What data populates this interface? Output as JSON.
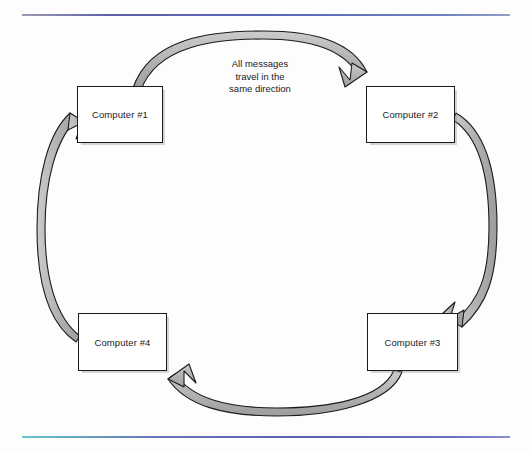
{
  "diagram": {
    "type": "ring-network-topology",
    "background_color": "#fdfdfd",
    "annotation": {
      "lines": [
        "All messages",
        "travel in the",
        "same direction"
      ],
      "full_text": "All messages travel in the same direction"
    },
    "nodes": [
      {
        "id": "computer-1",
        "label": "Computer #1",
        "position": "top-left"
      },
      {
        "id": "computer-2",
        "label": "Computer #2",
        "position": "top-right"
      },
      {
        "id": "computer-3",
        "label": "Computer #3",
        "position": "bottom-right"
      },
      {
        "id": "computer-4",
        "label": "Computer #4",
        "position": "bottom-left"
      }
    ],
    "connections": [
      {
        "from": "computer-1",
        "to": "computer-2",
        "arc": "top",
        "direction": "clockwise"
      },
      {
        "from": "computer-2",
        "to": "computer-3",
        "arc": "right",
        "direction": "clockwise"
      },
      {
        "from": "computer-3",
        "to": "computer-4",
        "arc": "bottom",
        "direction": "clockwise"
      },
      {
        "from": "computer-4",
        "to": "computer-1",
        "arc": "left",
        "direction": "clockwise"
      }
    ],
    "colors": {
      "arrow_fill": "#b3b3b3",
      "arrow_stroke": "#1b1b1b",
      "node_border": "#1b1b1b",
      "node_fill": "#ffffff",
      "text": "#1b1b1b",
      "rule_top": "#5a6ab6",
      "rule_bottom": "#5a5fb2"
    }
  }
}
